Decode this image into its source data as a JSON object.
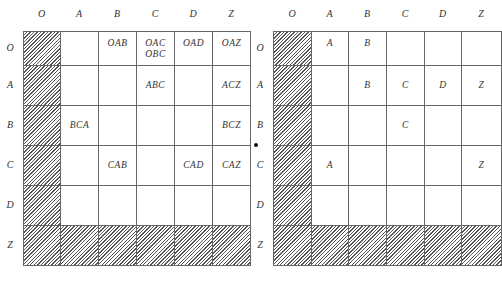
{
  "tables": [
    {
      "name": "left",
      "col_headers": [
        "O",
        "A",
        "B",
        "C",
        "D",
        "Z"
      ],
      "row_headers": [
        "O",
        "A",
        "B",
        "C",
        "D",
        "Z"
      ],
      "cells": [
        [
          "",
          "",
          "OAB",
          "OAC\nOBC",
          "OAD",
          "OAZ"
        ],
        [
          "",
          "",
          "",
          "ABC",
          "",
          "ACZ"
        ],
        [
          "",
          "BCA",
          "",
          "",
          "",
          "BCZ"
        ],
        [
          "",
          "",
          "CAB",
          "",
          "CAD",
          "CAZ"
        ],
        [
          "",
          "",
          "",
          "",
          "",
          ""
        ],
        [
          "",
          "",
          "",
          "",
          "",
          ""
        ]
      ],
      "hatched": "column O and row Z"
    },
    {
      "name": "right",
      "col_headers": [
        "O",
        "A",
        "B",
        "C",
        "D",
        "Z"
      ],
      "row_headers": [
        "O",
        "A",
        "B",
        "C",
        "D",
        "Z"
      ],
      "cells": [
        [
          "",
          "A",
          "B",
          "",
          "",
          ""
        ],
        [
          "",
          "",
          "B",
          "C",
          "D",
          "Z"
        ],
        [
          "",
          "",
          "",
          "C",
          "",
          ""
        ],
        [
          "",
          "A",
          "",
          "",
          "",
          "Z"
        ],
        [
          "",
          "",
          "",
          "",
          "",
          ""
        ],
        [
          "",
          "",
          "",
          "",
          "",
          ""
        ]
      ],
      "hatched": "column O and row Z"
    }
  ]
}
